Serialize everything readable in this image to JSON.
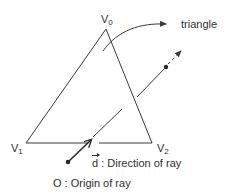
{
  "diagram": {
    "vertices": [
      {
        "id": "v0",
        "label": "V",
        "sub": "0",
        "x": 106,
        "y": 29
      },
      {
        "id": "v1",
        "label": "V",
        "sub": "1",
        "x": 26,
        "y": 143
      },
      {
        "id": "v2",
        "label": "V",
        "sub": "2",
        "x": 152,
        "y": 143
      }
    ],
    "labels": {
      "triangle": "triangle",
      "direction_symbol": "d",
      "direction_text": " : Direction of ray",
      "origin_text": "O : Origin of ray"
    },
    "colors": {
      "stroke": "#3a3a3a",
      "text": "#2f2f2f",
      "background": "#ffffff"
    }
  }
}
